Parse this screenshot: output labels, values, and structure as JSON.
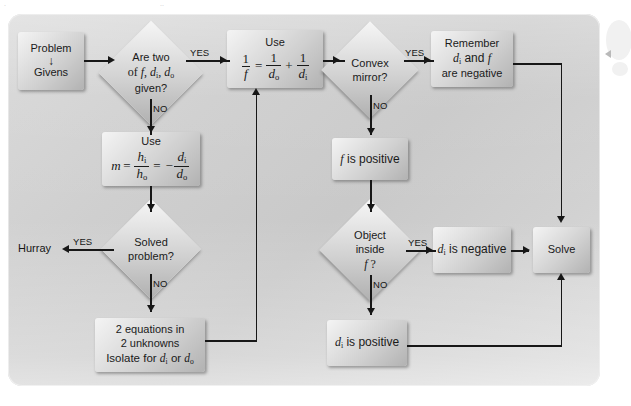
{
  "figure": {
    "type": "flowchart",
    "panel_color": "#cfcfcf",
    "node_fill": "#dcdcdc",
    "line_color": "#171717"
  },
  "labels": {
    "yes": "YES",
    "no": "NO",
    "hurray": "Hurray"
  },
  "nodes": {
    "problem_givens": {
      "line1": "Problem",
      "arrow": "↓",
      "line2": "Givens"
    },
    "are_two_given": {
      "line1": "Are two",
      "line2": "of f, dᵢ, dₒ",
      "line3": "given?"
    },
    "use_mirror_eq": {
      "label": "Use",
      "equation": "1/f = 1/dₒ + 1/dᵢ"
    },
    "use_mag_eq": {
      "label": "Use",
      "equation": "m = hᵢ/hₒ = −dᵢ/dₒ"
    },
    "solved_problem": {
      "line1": "Solved",
      "line2": "problem?"
    },
    "two_equations": {
      "line1": "2 equations in",
      "line2": "2 unknowns",
      "line3": "Isolate for dᵢ or dₒ"
    },
    "convex_mirror": {
      "line1": "Convex",
      "line2": "mirror?"
    },
    "remember_negative": {
      "line1": "Remember",
      "line2": "dᵢ and f",
      "line3": "are negative"
    },
    "f_is_positive": {
      "text": "f is positive"
    },
    "object_inside_f": {
      "line1": "Object",
      "line2": "inside",
      "line3": "f ?"
    },
    "di_is_negative": {
      "text": "dᵢ is negative"
    },
    "di_is_positive": {
      "text": "dᵢ is positive"
    },
    "solve": {
      "text": "Solve"
    }
  },
  "edges": [
    {
      "from": "problem_givens",
      "to": "are_two_given",
      "label": ""
    },
    {
      "from": "are_two_given",
      "to": "use_mirror_eq",
      "label": "YES"
    },
    {
      "from": "are_two_given",
      "to": "use_mag_eq",
      "label": "NO"
    },
    {
      "from": "use_mag_eq",
      "to": "solved_problem",
      "label": ""
    },
    {
      "from": "solved_problem",
      "to": "hurray",
      "label": "YES"
    },
    {
      "from": "solved_problem",
      "to": "two_equations",
      "label": "NO"
    },
    {
      "from": "two_equations",
      "to": "use_mirror_eq",
      "label": ""
    },
    {
      "from": "use_mirror_eq",
      "to": "convex_mirror",
      "label": ""
    },
    {
      "from": "convex_mirror",
      "to": "remember_negative",
      "label": "YES"
    },
    {
      "from": "convex_mirror",
      "to": "f_is_positive",
      "label": "NO"
    },
    {
      "from": "remember_negative",
      "to": "solve",
      "label": ""
    },
    {
      "from": "f_is_positive",
      "to": "object_inside_f",
      "label": ""
    },
    {
      "from": "object_inside_f",
      "to": "di_is_negative",
      "label": "YES"
    },
    {
      "from": "object_inside_f",
      "to": "di_is_positive",
      "label": "NO"
    },
    {
      "from": "di_is_negative",
      "to": "solve",
      "label": ""
    },
    {
      "from": "di_is_positive",
      "to": "solve",
      "label": ""
    }
  ],
  "margin": {
    "pointer_icon": "triangle-left-icon"
  }
}
